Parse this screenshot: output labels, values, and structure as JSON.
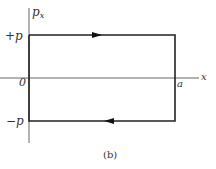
{
  "diagram": {
    "type": "phase-space trajectory",
    "caption": "(b)",
    "axes": {
      "vertical_label_base": "p",
      "vertical_label_sub": "x",
      "horizontal_label": "x",
      "origin_label": "0"
    },
    "ticks": {
      "plus_p": "+p",
      "minus_p": "−p",
      "a": "a"
    },
    "path": {
      "shape": "rectangle",
      "corners": [
        [
          "0",
          "+p"
        ],
        [
          "a",
          "+p"
        ],
        [
          "a",
          "−p"
        ],
        [
          "0",
          "−p"
        ]
      ],
      "top_arrow_direction": "right",
      "bottom_arrow_direction": "left",
      "stroke_color": "#222222"
    },
    "axis_color": "#555555"
  }
}
